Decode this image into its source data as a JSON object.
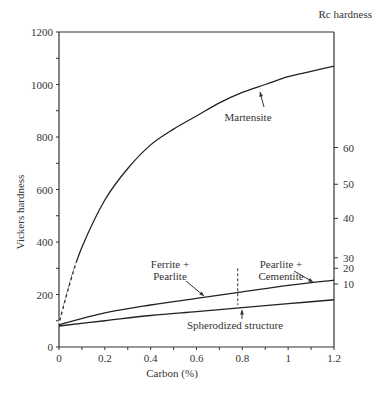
{
  "chart_data": {
    "type": "line",
    "title": "",
    "xlabel": "Carbon (%)",
    "ylabel": "Vickers hardness",
    "y2label": "Rc hardness",
    "xlim": [
      0,
      1.2
    ],
    "ylim": [
      0,
      1200
    ],
    "x_ticks": [
      "0",
      "0.2",
      "0.4",
      "0.6",
      "0.8",
      "1",
      "1.2"
    ],
    "y_ticks": [
      "0",
      "200",
      "400",
      "600",
      "800",
      "1000",
      "1200"
    ],
    "y2_ticks": [
      {
        "label": "10",
        "vickers": 240
      },
      {
        "label": "20",
        "vickers": 300
      },
      {
        "label": "30",
        "vickers": 340
      },
      {
        "label": "40",
        "vickers": 490
      },
      {
        "label": "50",
        "vickers": 620
      },
      {
        "label": "60",
        "vickers": 760
      }
    ],
    "grid": false,
    "series": [
      {
        "name": "Martensite",
        "x": [
          0,
          0.05,
          0.1,
          0.2,
          0.3,
          0.4,
          0.5,
          0.6,
          0.7,
          0.8,
          0.9,
          1.0,
          1.1,
          1.2
        ],
        "y": [
          90,
          250,
          380,
          560,
          680,
          770,
          830,
          880,
          930,
          970,
          1000,
          1030,
          1050,
          1070
        ],
        "dashed_segment": [
          0,
          0.08
        ]
      },
      {
        "name": "Ferrite + Pearlite / Pearlite + Cementite",
        "x": [
          0,
          0.2,
          0.4,
          0.6,
          0.8,
          1.0,
          1.2
        ],
        "y": [
          85,
          130,
          160,
          185,
          210,
          235,
          255
        ]
      },
      {
        "name": "Spherodized structure",
        "x": [
          0,
          0.2,
          0.4,
          0.6,
          0.8,
          1.0,
          1.2
        ],
        "y": [
          80,
          100,
          120,
          135,
          150,
          165,
          180
        ]
      }
    ],
    "annotations": [
      {
        "text": "Martensite",
        "x": 0.83,
        "y": 920
      },
      {
        "text": "Ferrite +",
        "x": 0.42,
        "y": 300
      },
      {
        "text": "Pearlite",
        "x": 0.42,
        "y": 270
      },
      {
        "text": "Pearlite +",
        "x": 0.95,
        "y": 300
      },
      {
        "text": "Cementite",
        "x": 0.95,
        "y": 270
      },
      {
        "text": "Spherodized structure",
        "x": 0.73,
        "y": 110
      },
      {
        "text": "eutectoid divider (dashed)",
        "x": 0.78,
        "y": 250
      }
    ]
  },
  "labels": {
    "ylabel": "Vickers hardness",
    "xlabel": "Carbon (%)",
    "y2label": "Rc hardness",
    "martensite": "Martensite",
    "fp1": "Ferrite  +",
    "fp2": "Pearlite",
    "pc1": "Pearlite  +",
    "pc2": "Cementite",
    "sph": "Spherodized structure"
  }
}
